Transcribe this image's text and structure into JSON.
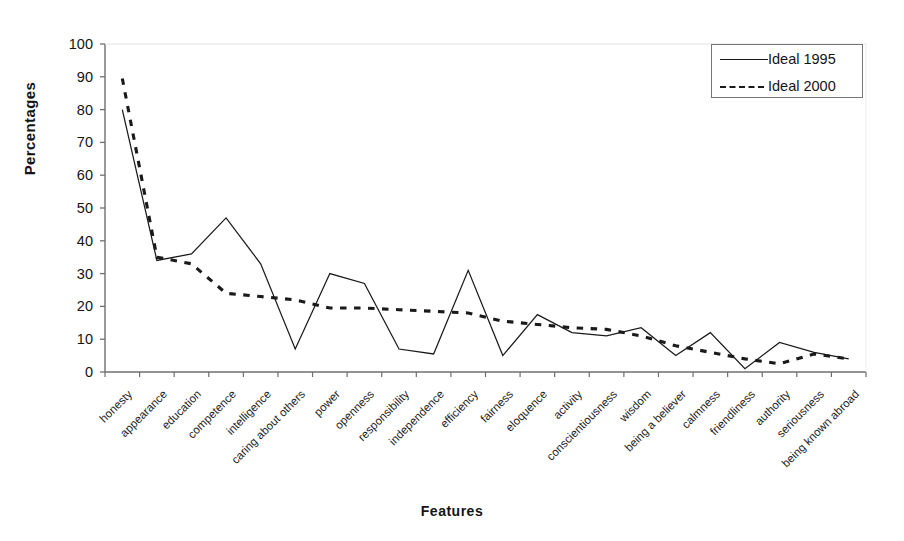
{
  "chart_data": {
    "type": "line",
    "title": "",
    "xlabel": "Features",
    "ylabel": "Percentages",
    "ylim": [
      0,
      100
    ],
    "ytick_step": 10,
    "yticks": [
      0,
      10,
      20,
      30,
      40,
      50,
      60,
      70,
      80,
      90,
      100
    ],
    "grid": false,
    "legend_position": "top-right",
    "categories": [
      "honesty",
      "appearance",
      "education",
      "competence",
      "intelligence",
      "caring about others",
      "power",
      "openness",
      "responsibility",
      "independence",
      "efficiency",
      "fairness",
      "eloquence",
      "activity",
      "conscientiousness",
      "wisdom",
      "being a believer",
      "calmness",
      "friendliness",
      "authority",
      "seriousness",
      "being known abroad"
    ],
    "series": [
      {
        "name": "Ideal 1995",
        "style": "solid",
        "color": "#1a1a1a",
        "values": [
          80,
          34,
          36,
          47,
          33,
          7,
          30,
          27,
          7,
          5.5,
          31,
          5,
          17.5,
          12,
          11,
          13.5,
          5,
          12,
          1,
          9,
          6,
          4
        ]
      },
      {
        "name": "Ideal 2000",
        "style": "dashed",
        "color": "#1a1a1a",
        "values": [
          89.5,
          35,
          33,
          24,
          23,
          22,
          19.5,
          19.5,
          19,
          18.5,
          18,
          15.5,
          14.5,
          13.5,
          13,
          11,
          8,
          6,
          4,
          2.5,
          5.5,
          4
        ]
      }
    ]
  },
  "legend": {
    "entries": [
      {
        "label": "Ideal 1995"
      },
      {
        "label": "Ideal 2000"
      }
    ]
  },
  "axes": {
    "y_title": "Percentages",
    "x_title": "Features"
  }
}
